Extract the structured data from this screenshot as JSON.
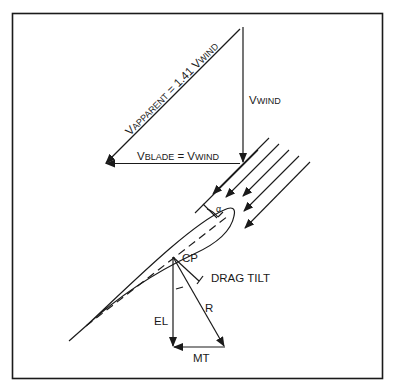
{
  "diagram": {
    "velocity_triangle": {
      "apparent_label_prefix": "V",
      "apparent_label_sub": "APPARENT",
      "apparent_label_rest": " = 1.41 V",
      "apparent_label_sub2": "WIND",
      "wind_label_prefix": "V",
      "wind_label_sub": "WIND",
      "blade_label_prefix": "V",
      "blade_label_sub": "BLADE",
      "blade_label_mid": " = V",
      "blade_label_sub2": "WIND"
    },
    "airfoil": {
      "alpha_label": "α",
      "cp_label": "CP",
      "drag_tilt_label": "DRAG TILT"
    },
    "forces": {
      "el_label": "EL",
      "r_label": "R",
      "mt_label": "MT"
    },
    "colors": {
      "line": "#1a1a1a",
      "background": "#ffffff"
    }
  }
}
